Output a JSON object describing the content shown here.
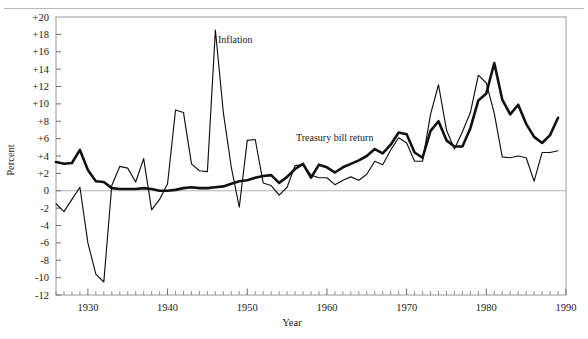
{
  "figure": {
    "top_rule": "horizontal-rule"
  },
  "labels": {
    "ylabel": "Percent",
    "xlabel": "Year",
    "inflation_label": "Inflation",
    "tbill_label": "Treasury bill return"
  },
  "axes": {
    "y_ticks": [
      "+20",
      "+18",
      "+16",
      "+14",
      "+12",
      "+10",
      "+8",
      "+6",
      "+4",
      "+2",
      "0",
      "-2",
      "-4",
      "-6",
      "-8",
      "-10",
      "-12"
    ],
    "y_values": [
      20,
      18,
      16,
      14,
      12,
      10,
      8,
      6,
      4,
      2,
      0,
      -2,
      -4,
      -6,
      -8,
      -10,
      -12
    ],
    "x_ticks": [
      "1930",
      "1940",
      "1950",
      "1960",
      "1970",
      "1980",
      "1990"
    ],
    "x_values": [
      1930,
      1940,
      1950,
      1960,
      1970,
      1980,
      1990
    ]
  },
  "chart_data": {
    "type": "line",
    "title": "",
    "xlabel": "Year",
    "ylabel": "Percent",
    "xlim": [
      1926,
      1990
    ],
    "ylim": [
      -12,
      20
    ],
    "grid": false,
    "legend": "inline-annotations",
    "x": [
      1926,
      1927,
      1928,
      1929,
      1930,
      1931,
      1932,
      1933,
      1934,
      1935,
      1936,
      1937,
      1938,
      1939,
      1940,
      1941,
      1942,
      1943,
      1944,
      1945,
      1946,
      1947,
      1948,
      1949,
      1950,
      1951,
      1952,
      1953,
      1954,
      1955,
      1956,
      1957,
      1958,
      1959,
      1960,
      1961,
      1962,
      1963,
      1964,
      1965,
      1966,
      1967,
      1968,
      1969,
      1970,
      1971,
      1972,
      1973,
      1974,
      1975,
      1976,
      1977,
      1978,
      1979,
      1980,
      1981,
      1982,
      1983,
      1984,
      1985,
      1986,
      1987,
      1988,
      1989
    ],
    "series": [
      {
        "name": "Inflation",
        "style": "thin",
        "values": [
          -1.5,
          -2.4,
          -1.0,
          0.4,
          -6.0,
          -9.6,
          -10.5,
          0.6,
          2.8,
          2.6,
          1.0,
          3.7,
          -2.2,
          -1.0,
          0.8,
          9.3,
          9.0,
          3.1,
          2.3,
          2.2,
          18.5,
          9.0,
          2.7,
          -1.9,
          5.8,
          5.9,
          0.9,
          0.6,
          -0.5,
          0.4,
          2.9,
          3.0,
          1.8,
          1.5,
          1.5,
          0.7,
          1.2,
          1.6,
          1.2,
          1.9,
          3.4,
          3.0,
          4.7,
          6.1,
          5.5,
          3.4,
          3.4,
          8.8,
          12.2,
          7.0,
          4.8,
          6.8,
          9.0,
          13.3,
          12.4,
          8.9,
          3.9,
          3.8,
          4.0,
          3.8,
          1.1,
          4.4,
          4.4,
          4.6
        ]
      },
      {
        "name": "Treasury bill return",
        "style": "thick",
        "values": [
          3.3,
          3.1,
          3.2,
          4.7,
          2.4,
          1.1,
          1.0,
          0.3,
          0.2,
          0.2,
          0.2,
          0.3,
          0.2,
          0.0,
          0.0,
          0.1,
          0.3,
          0.4,
          0.3,
          0.3,
          0.4,
          0.5,
          0.8,
          1.1,
          1.2,
          1.5,
          1.7,
          1.8,
          0.9,
          1.6,
          2.5,
          3.1,
          1.5,
          3.0,
          2.7,
          2.1,
          2.7,
          3.1,
          3.5,
          4.0,
          4.8,
          4.3,
          5.3,
          6.7,
          6.5,
          4.4,
          3.8,
          6.9,
          8.0,
          5.8,
          5.1,
          5.1,
          7.2,
          10.4,
          11.2,
          14.7,
          10.5,
          8.8,
          9.9,
          7.7,
          6.2,
          5.5,
          6.4,
          8.4
        ]
      }
    ]
  }
}
